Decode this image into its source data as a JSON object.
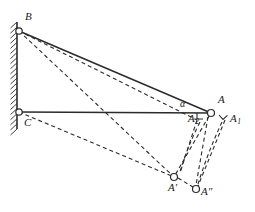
{
  "figure": {
    "type": "geometric-mechanism-diagram",
    "background_color": "#ffffff",
    "line_color": "#2b2b2b",
    "node_fill": "#ffffff",
    "node_stroke": "#2b2b2b",
    "wall": {
      "name": "hatched-wall",
      "x": 17,
      "y_top": 22,
      "y_bottom": 129,
      "hatch_count": 22
    },
    "nodes": [
      {
        "id": "B",
        "label": "B",
        "cx": 19,
        "cy": 31,
        "r": 3.2,
        "label_x": 25,
        "label_y": 20
      },
      {
        "id": "C",
        "label": "C",
        "cx": 19,
        "cy": 112,
        "r": 3.2,
        "label_x": 24,
        "label_y": 126
      },
      {
        "id": "A",
        "label": "A",
        "cx": 211,
        "cy": 113,
        "r": 3.5,
        "label_x": 218,
        "label_y": 103
      },
      {
        "id": "Ap",
        "label": "A′",
        "cx": 174,
        "cy": 177,
        "r": 3.5,
        "label_x": 168,
        "label_y": 191
      },
      {
        "id": "App",
        "label": "A″",
        "cx": 196,
        "cy": 189,
        "r": 3.5,
        "label_x": 201,
        "label_y": 195
      }
    ],
    "text_labels": [
      {
        "id": "alpha",
        "text": "α",
        "x": 180,
        "y": 107
      },
      {
        "id": "A2",
        "text": "A",
        "sub": "2",
        "x": 188,
        "y": 122
      },
      {
        "id": "A1",
        "text": "A",
        "sub": "1",
        "x": 230,
        "y": 122
      }
    ],
    "solid_segments": [
      {
        "name": "beam-B-A",
        "x1": 19,
        "y1": 31,
        "x2": 211,
        "y2": 113
      },
      {
        "name": "bar-C-A",
        "x1": 19,
        "y1": 112,
        "x2": 211,
        "y2": 113
      }
    ],
    "dashed_segments": [
      {
        "name": "B-to-Aprime",
        "x1": 19,
        "y1": 31,
        "x2": 174,
        "y2": 177
      },
      {
        "name": "B-to-A2",
        "x1": 19,
        "y1": 31,
        "x2": 197,
        "y2": 120
      },
      {
        "name": "C-to-Aprime",
        "x1": 19,
        "y1": 112,
        "x2": 174,
        "y2": 177
      },
      {
        "name": "A-to-Aprime",
        "x1": 209,
        "y1": 116,
        "x2": 174,
        "y2": 177
      },
      {
        "name": "A2-to-Aprime",
        "x1": 197,
        "y1": 120,
        "x2": 180,
        "y2": 173
      },
      {
        "name": "A-to-Adoubleprime",
        "x1": 208,
        "y1": 117,
        "x2": 196,
        "y2": 185
      },
      {
        "name": "A1-to-Adoubleprime",
        "x1": 225,
        "y1": 120,
        "x2": 198,
        "y2": 186
      },
      {
        "name": "Aprime-to-Adoubleprime",
        "x1": 178,
        "y1": 178,
        "x2": 193,
        "y2": 187
      }
    ],
    "angle_marks": [
      {
        "name": "right-angle-at-A2",
        "x": 197,
        "y": 113,
        "size": 6
      },
      {
        "name": "right-angle-at-A1",
        "x": 219,
        "y": 115,
        "size": 6,
        "rotate": -42
      }
    ],
    "arcs": [
      {
        "name": "arc-A-to-Aprime",
        "d": "M 200 122 Q 186 150 180 172"
      },
      {
        "name": "arc-A1-to-Adbl",
        "d": "M 222 122 Q 208 152 198 184"
      }
    ]
  }
}
